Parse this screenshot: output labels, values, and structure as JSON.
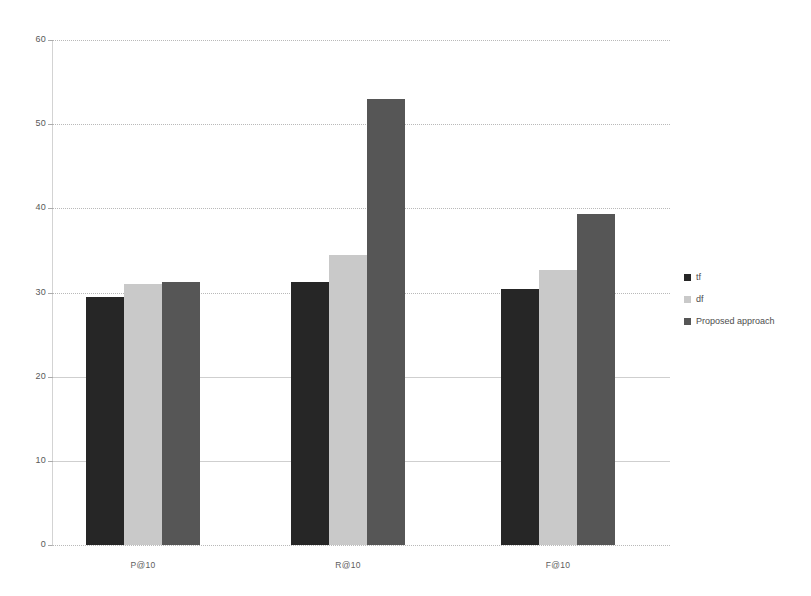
{
  "chart_data": {
    "type": "bar",
    "title": "",
    "subtitle": "",
    "xlabel": "",
    "ylabel": "",
    "categories": [
      "P@10",
      "R@10",
      "F@10"
    ],
    "series": [
      {
        "name": "tf",
        "color": "#262626",
        "values": [
          29.5,
          31.3,
          30.4
        ]
      },
      {
        "name": "df",
        "color": "#c9c9c9",
        "values": [
          31.0,
          34.5,
          32.7
        ]
      },
      {
        "name": "Proposed approach",
        "color": "#565656",
        "values": [
          31.3,
          53.0,
          39.3
        ]
      }
    ],
    "ylim": [
      0,
      60
    ],
    "yticks": [
      0,
      10,
      20,
      30,
      40,
      50,
      60
    ],
    "ytick_labels": [
      "0",
      "10",
      "20",
      "30",
      "40",
      "50",
      "60"
    ],
    "grid": true,
    "grid_axis": "y",
    "legend_position": "right",
    "legend_entries": [
      "tf",
      "df",
      "Proposed approach"
    ]
  },
  "axes": {
    "y_tick_labels": [
      "60",
      "50",
      "40",
      "30",
      "20",
      "10",
      "0"
    ],
    "x_tick_labels": [
      "P@10",
      "R@10",
      "F@10"
    ]
  },
  "legend": {
    "items": [
      {
        "label": "tf"
      },
      {
        "label": "df"
      },
      {
        "label": "Proposed approach"
      }
    ]
  },
  "colors": {
    "series_tf": "#262626",
    "series_df": "#c9c9c9",
    "series_proposed": "#565656",
    "gridline": "#b9b9b9",
    "axis": "#d3d3d3",
    "text": "#4d4d4d",
    "background": "#ffffff"
  }
}
